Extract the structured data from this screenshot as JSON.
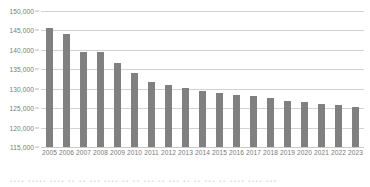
{
  "chart_data": {
    "type": "bar",
    "title": "",
    "subtitle": "",
    "xlabel": "",
    "ylabel": "",
    "categories": [
      "2005",
      "2006",
      "2007",
      "2008",
      "2009",
      "2010",
      "2011",
      "2012",
      "2013",
      "2014",
      "2015",
      "2016",
      "2017",
      "2018",
      "2019",
      "2020",
      "2021",
      "2022",
      "2023"
    ],
    "values": [
      145700,
      144200,
      139500,
      139500,
      136500,
      134000,
      131700,
      131000,
      130200,
      129400,
      129000,
      128400,
      128100,
      127500,
      126900,
      126700,
      126000,
      125800,
      125400
    ],
    "series": [
      {
        "name": "",
        "values": [
          145700,
          144200,
          139500,
          139500,
          136500,
          134000,
          131700,
          131000,
          130200,
          129400,
          129000,
          128400,
          128100,
          127500,
          126900,
          126700,
          126000,
          125800,
          125400
        ]
      }
    ],
    "ylim": [
      115000,
      150000
    ],
    "ytick_values": [
      115000,
      120000,
      125000,
      130000,
      135000,
      140000,
      145000,
      150000
    ],
    "ytick_labels": [
      "115,000",
      "120,000",
      "125,000",
      "130,000",
      "135,000",
      "140,000",
      "145,000",
      "150,000"
    ],
    "y_tick_step": 5000,
    "grid": "horizontal",
    "legend": "none",
    "bar_color": "#808080",
    "gridline_color": "#d2d2d2",
    "axis_label_color": "#7a7a7a",
    "background_color": "#ffffff",
    "annotations": []
  },
  "caption": {
    "fragment": "▪▪▪▪  ▪▪▪▪▪  ▪▪▪▪  ▪▪ ▪▪  ▪▪▪  ▪▪▪▪  ▪▪ ▪▪  ▪▪▪  ▪▪ ▪▪▪ ▪▪ ▪▪  ▪▪▪ ▪▪ ▪▪▪▪  ▪▪▪▪ ▪▪▪"
  }
}
